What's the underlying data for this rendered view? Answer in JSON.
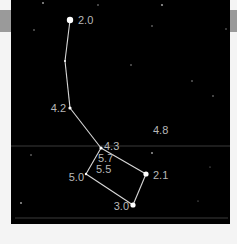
{
  "chart": {
    "colors": {
      "sky": "#000000",
      "frame": "#f4f4f4",
      "band": "#9a9a9a",
      "line": "#d8d8d8",
      "label": "#b8b8b8",
      "guide": "#3a3a3a"
    },
    "constellation_stars": [
      {
        "id": "s1",
        "x": 70,
        "y": 20,
        "r": 3.2,
        "label": "2.0",
        "lx": 78,
        "ly": 24,
        "anchor": "start"
      },
      {
        "id": "s2",
        "x": 65,
        "y": 61,
        "r": 1.0,
        "label": "",
        "lx": 0,
        "ly": 0,
        "anchor": "start"
      },
      {
        "id": "s3",
        "x": 70,
        "y": 108,
        "r": 1.6,
        "label": "4.2",
        "lx": 66,
        "ly": 112,
        "anchor": "end"
      },
      {
        "id": "s4",
        "x": 101,
        "y": 148,
        "r": 1.6,
        "label": "4.3",
        "lx": 104,
        "ly": 150,
        "anchor": "start"
      },
      {
        "id": "s5",
        "x": 86,
        "y": 174,
        "r": 1.2,
        "label": "5.0",
        "lx": 84,
        "ly": 181,
        "anchor": "end"
      },
      {
        "id": "s6",
        "x": 146,
        "y": 174,
        "r": 2.6,
        "label": "2.1",
        "lx": 153,
        "ly": 179,
        "anchor": "start"
      },
      {
        "id": "s7",
        "x": 133,
        "y": 205,
        "r": 2.6,
        "label": "3.0",
        "lx": 129,
        "ly": 210,
        "anchor": "end"
      }
    ],
    "extra_labels": [
      {
        "text": "5.7",
        "x": 98,
        "y": 162
      },
      {
        "text": "5.5",
        "x": 96,
        "y": 173
      },
      {
        "text": "4.8",
        "x": 153,
        "y": 134
      }
    ],
    "lines": [
      [
        "s1",
        "s2"
      ],
      [
        "s2",
        "s3"
      ],
      [
        "s3",
        "s4"
      ],
      [
        "s4",
        "s6"
      ],
      [
        "s6",
        "s7"
      ],
      [
        "s7",
        "s5"
      ],
      [
        "s5",
        "s4"
      ]
    ],
    "background_stars": [
      {
        "x": 43,
        "y": 3,
        "r": 1.0
      },
      {
        "x": 98,
        "y": 5,
        "r": 0.8
      },
      {
        "x": 162,
        "y": 5,
        "r": 1.1
      },
      {
        "x": 34,
        "y": 30,
        "r": 0.8
      },
      {
        "x": 152,
        "y": 26,
        "r": 0.8
      },
      {
        "x": 226,
        "y": 29,
        "r": 0.7
      },
      {
        "x": 131,
        "y": 65,
        "r": 0.8
      },
      {
        "x": 192,
        "y": 81,
        "r": 0.8
      },
      {
        "x": 213,
        "y": 96,
        "r": 0.8
      },
      {
        "x": 31,
        "y": 155,
        "r": 0.8
      },
      {
        "x": 152,
        "y": 153,
        "r": 1.0
      },
      {
        "x": 210,
        "y": 167,
        "r": 0.6
      },
      {
        "x": 21,
        "y": 203,
        "r": 1.0
      },
      {
        "x": 198,
        "y": 201,
        "r": 0.6
      }
    ],
    "guide_lines": [
      {
        "y": 146,
        "x1": 11,
        "x2": 230
      },
      {
        "y": 218,
        "x1": 15,
        "x2": 228
      }
    ]
  }
}
